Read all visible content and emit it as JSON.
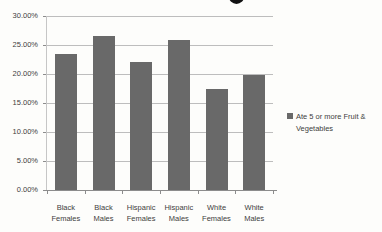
{
  "background_color": "#fdfdfb",
  "chart_data": {
    "type": "bar",
    "categories": [
      "Black Females",
      "Black Males",
      "Hispanic Females",
      "Hispanic Males",
      "White Females",
      "White Males"
    ],
    "series": [
      {
        "name": "Ate 5 or more Fruit & Vegetables",
        "values": [
          23.5,
          26.6,
          22.0,
          25.8,
          17.5,
          19.9
        ]
      }
    ],
    "ylim": [
      0,
      30
    ],
    "ytick_step": 5,
    "yticks": [
      "30.00%",
      "25.00%",
      "20.00%",
      "15.00%",
      "10.00%",
      "5.00%",
      "0.00%"
    ],
    "grid": true,
    "legend_position": "right",
    "bar_color": "#696969",
    "gridline_color": "#bdbdbd",
    "axis_color": "#8c8c8c",
    "text_color": "#3d3d3d"
  },
  "legend": {
    "marker": "square",
    "marker_color": "#696969",
    "label": "Ate 5 or more Fruit & Vegetables"
  }
}
